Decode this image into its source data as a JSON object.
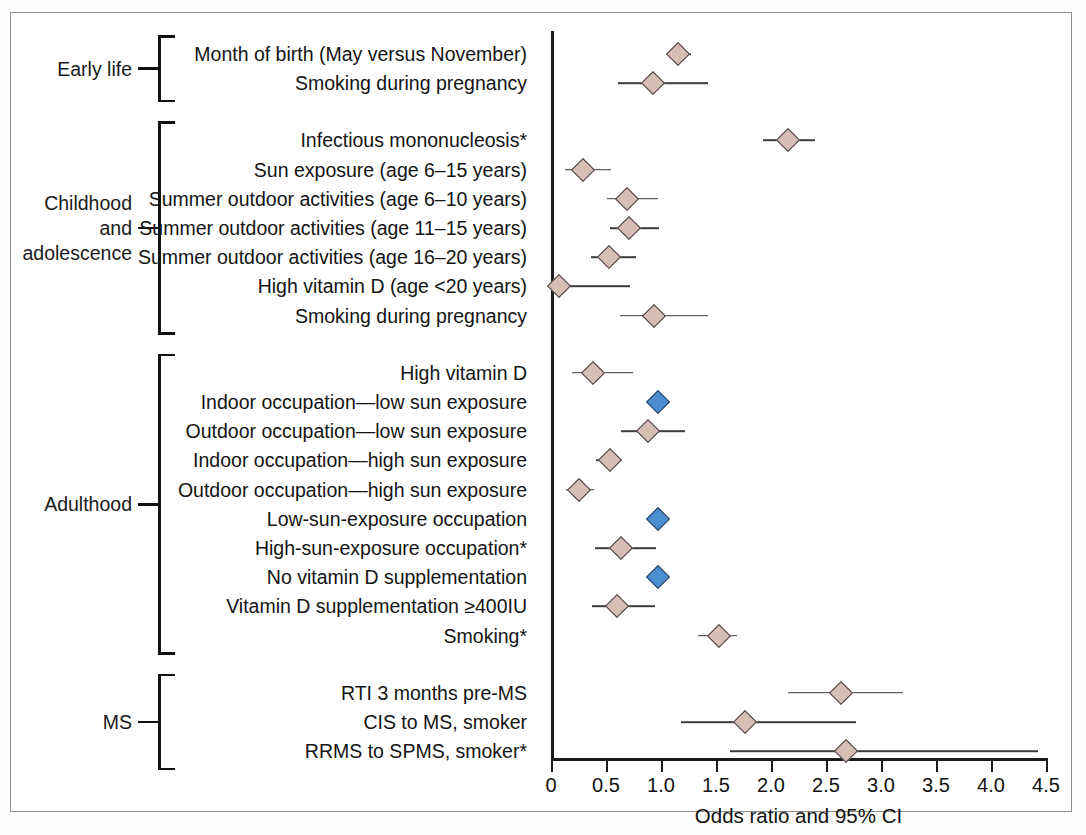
{
  "figure": {
    "xaxis_title": "Odds ratio and 95% CI",
    "colors": {
      "marker_rose": "#d6bdb5",
      "marker_blue": "#4b8ed2",
      "axis": "#1b1b1b",
      "ci_line": "#3b3b3b",
      "frame": "#8d8d8d"
    }
  },
  "chart_data": {
    "type": "scatter",
    "subtype": "forest-plot",
    "title": "",
    "xlabel": "Odds ratio and 95% CI",
    "ylabel": "",
    "xlim": [
      0,
      4.5
    ],
    "xticks": [
      0,
      0.5,
      1.0,
      1.5,
      2.0,
      2.5,
      3.0,
      3.5,
      4.0,
      4.5
    ],
    "xtick_labels": [
      "0",
      "0.5",
      "1.0",
      "1.5",
      "2.0",
      "2.5",
      "3.0",
      "3.5",
      "4.0",
      "4.5"
    ],
    "grid": false,
    "legend": "none",
    "marker_shape": "diamond",
    "groups": [
      {
        "name": "Early life",
        "label": "Early life",
        "rows": [
          {
            "label": "Month of birth (May versus November)",
            "or": 1.15,
            "ci_low": 1.05,
            "ci_high": 1.27,
            "color": "rose"
          },
          {
            "label": "Smoking during pregnancy",
            "or": 0.93,
            "ci_low": 0.61,
            "ci_high": 1.43,
            "color": "rose"
          }
        ]
      },
      {
        "name": "Childhood and adolescence",
        "label": "Childhood\nand\nadolescence",
        "rows": [
          {
            "label": "Infectious mononucleosis*",
            "or": 2.15,
            "ci_low": 1.93,
            "ci_high": 2.4,
            "color": "rose"
          },
          {
            "label": "Sun exposure (age 6–15 years)",
            "or": 0.29,
            "ci_low": 0.13,
            "ci_high": 0.55,
            "color": "rose"
          },
          {
            "label": "Summer outdoor activities (age 6–10 years)",
            "or": 0.69,
            "ci_low": 0.51,
            "ci_high": 0.97,
            "color": "rose"
          },
          {
            "label": "Summer outdoor activities (age 11–15 years)",
            "or": 0.71,
            "ci_low": 0.54,
            "ci_high": 0.98,
            "color": "rose"
          },
          {
            "label": "Summer outdoor activities (age 16–20 years)",
            "or": 0.53,
            "ci_low": 0.36,
            "ci_high": 0.77,
            "color": "rose"
          },
          {
            "label": "High vitamin D (age <20 years)",
            "or": 0.07,
            "ci_low": 0.0,
            "ci_high": 0.72,
            "color": "rose"
          },
          {
            "label": "Smoking during pregnancy",
            "or": 0.94,
            "ci_low": 0.63,
            "ci_high": 1.43,
            "color": "rose"
          }
        ]
      },
      {
        "name": "Adulthood",
        "label": "Adulthood",
        "rows": [
          {
            "label": "High vitamin D",
            "or": 0.38,
            "ci_low": 0.19,
            "ci_high": 0.75,
            "color": "rose"
          },
          {
            "label": "Indoor occupation—low sun exposure",
            "or": 0.97,
            "ci_low": null,
            "ci_high": null,
            "color": "blue"
          },
          {
            "label": "Outdoor occupation—low sun exposure",
            "or": 0.88,
            "ci_low": 0.64,
            "ci_high": 1.22,
            "color": "rose"
          },
          {
            "label": "Indoor occupation—high sun exposure",
            "or": 0.54,
            "ci_low": 0.41,
            "ci_high": 0.65,
            "color": "rose"
          },
          {
            "label": "Outdoor occupation—high sun exposure",
            "or": 0.25,
            "ci_low": 0.14,
            "ci_high": 0.39,
            "color": "rose"
          },
          {
            "label": "Low-sun-exposure occupation",
            "or": 0.97,
            "ci_low": null,
            "ci_high": null,
            "color": "blue"
          },
          {
            "label": "High-sun-exposure occupation*",
            "or": 0.64,
            "ci_low": 0.4,
            "ci_high": 0.95,
            "color": "rose"
          },
          {
            "label": "No vitamin D supplementation",
            "or": 0.97,
            "ci_low": null,
            "ci_high": null,
            "color": "blue"
          },
          {
            "label": "Vitamin D supplementation ≥400IU",
            "or": 0.6,
            "ci_low": 0.37,
            "ci_high": 0.95,
            "color": "rose"
          },
          {
            "label": "Smoking*",
            "or": 1.53,
            "ci_low": 1.34,
            "ci_high": 1.69,
            "color": "rose"
          }
        ]
      },
      {
        "name": "MS",
        "label": "MS",
        "rows": [
          {
            "label": "RTI 3 months pre-MS",
            "or": 2.64,
            "ci_low": 2.15,
            "ci_high": 3.2,
            "color": "rose"
          },
          {
            "label": "CIS to MS, smoker",
            "or": 1.76,
            "ci_low": 1.18,
            "ci_high": 2.77,
            "color": "rose"
          },
          {
            "label": "RRMS to SPMS, smoker*",
            "or": 2.68,
            "ci_low": 1.63,
            "ci_high": 4.43,
            "color": "rose"
          }
        ]
      }
    ]
  }
}
